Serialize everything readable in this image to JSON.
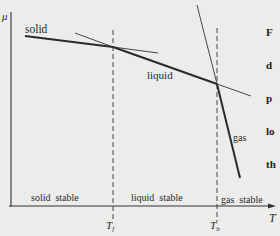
{
  "diagram": {
    "type": "chemical-potential-vs-temperature",
    "axes": {
      "ylabel": "μ",
      "xlabel": "T"
    },
    "curves": [
      {
        "name": "solid",
        "label": "solid"
      },
      {
        "name": "liquid",
        "label": "liquid"
      },
      {
        "name": "gas",
        "label": "gas"
      }
    ],
    "transition_markers": [
      {
        "name": "freezing",
        "label": "T",
        "subscript": "f"
      },
      {
        "name": "boiling",
        "label": "T",
        "subscript": "b"
      }
    ],
    "regions": [
      {
        "name": "solid-stable",
        "label": "solid  stable"
      },
      {
        "name": "liquid-stable",
        "label": "liquid  stable"
      },
      {
        "name": "gas-stable",
        "label": "gas  stable"
      }
    ],
    "truncated_side_text": [
      "F",
      "d",
      "p",
      "lo",
      "th"
    ]
  }
}
